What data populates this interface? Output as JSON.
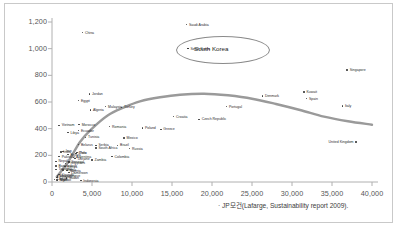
{
  "caption": "· JP모건(Lafarge, Sustainability report 2009).",
  "highlight": {
    "label": "South Korea"
  },
  "colors": {
    "trend_curve": "#9a9a9a",
    "point": "#3a3a3a",
    "axis": "#b0b0b0",
    "text": "#555555",
    "border": "#c9c9c9",
    "background": "#ffffff"
  },
  "chart_data": {
    "type": "scatter",
    "title": "",
    "xlabel": "",
    "ylabel": "",
    "xlim": [
      0,
      40000
    ],
    "ylim": [
      0,
      1200
    ],
    "xticks": [
      "0",
      "5,000",
      "10,000",
      "15,000",
      "20,000",
      "25,000",
      "30,000",
      "35,000",
      "40,000"
    ],
    "xtick_values": [
      0,
      5000,
      10000,
      15000,
      20000,
      25000,
      30000,
      35000,
      40000
    ],
    "yticks": [
      "0",
      "200",
      "400",
      "600",
      "800",
      "1,000",
      "1,200"
    ],
    "ytick_values": [
      0,
      200,
      400,
      600,
      800,
      1000,
      1200
    ],
    "grid": false,
    "legend": "none",
    "annotations": [
      {
        "text": "South Korea",
        "x": 17000,
        "y": 1000,
        "shape": "ellipse-callout"
      }
    ],
    "trend_line": {
      "name": "fitted curve",
      "color": "#9a9a9a",
      "points": [
        {
          "x": 600,
          "y": 40
        },
        {
          "x": 2000,
          "y": 150
        },
        {
          "x": 3500,
          "y": 300
        },
        {
          "x": 5000,
          "y": 400
        },
        {
          "x": 7000,
          "y": 500
        },
        {
          "x": 9000,
          "y": 560
        },
        {
          "x": 11000,
          "y": 605
        },
        {
          "x": 13500,
          "y": 635
        },
        {
          "x": 16000,
          "y": 655
        },
        {
          "x": 19000,
          "y": 662
        },
        {
          "x": 22000,
          "y": 650
        },
        {
          "x": 25000,
          "y": 625
        },
        {
          "x": 28000,
          "y": 585
        },
        {
          "x": 31000,
          "y": 540
        },
        {
          "x": 34000,
          "y": 490
        },
        {
          "x": 37000,
          "y": 455
        },
        {
          "x": 40000,
          "y": 430
        }
      ]
    },
    "points": [
      {
        "label": "Saudi Arabia",
        "x": 16800,
        "y": 1180,
        "label_pos": "right"
      },
      {
        "label": "China",
        "x": 3800,
        "y": 1120,
        "label_pos": "right"
      },
      {
        "label": "South Korea",
        "x": 17000,
        "y": 1000,
        "label_pos": "right"
      },
      {
        "label": "Singapore",
        "x": 36900,
        "y": 840,
        "label_pos": "right"
      },
      {
        "label": "Kuwait",
        "x": 31500,
        "y": 675,
        "label_pos": "right"
      },
      {
        "label": "Jordan",
        "x": 4700,
        "y": 660,
        "label_pos": "right"
      },
      {
        "label": "Denmark",
        "x": 26300,
        "y": 645,
        "label_pos": "right"
      },
      {
        "label": "Spain",
        "x": 31800,
        "y": 625,
        "label_pos": "right"
      },
      {
        "label": "Egypt",
        "x": 3300,
        "y": 610,
        "label_pos": "right"
      },
      {
        "label": "Italy",
        "x": 36300,
        "y": 570,
        "label_pos": "right"
      },
      {
        "label": "Portugal",
        "x": 21800,
        "y": 565,
        "label_pos": "right"
      },
      {
        "label": "Malaysia",
        "x": 6700,
        "y": 565,
        "label_pos": "right"
      },
      {
        "label": "Turkey",
        "x": 8700,
        "y": 560,
        "label_pos": "right"
      },
      {
        "label": "Algeria",
        "x": 4800,
        "y": 540,
        "label_pos": "right"
      },
      {
        "label": "Croatia",
        "x": 15200,
        "y": 490,
        "label_pos": "right"
      },
      {
        "label": "Czech Republic",
        "x": 18400,
        "y": 470,
        "label_pos": "right"
      },
      {
        "label": "Morocco",
        "x": 3400,
        "y": 430,
        "label_pos": "right"
      },
      {
        "label": "Vietnam",
        "x": 900,
        "y": 425,
        "label_pos": "right"
      },
      {
        "label": "Romania",
        "x": 7200,
        "y": 415,
        "label_pos": "right"
      },
      {
        "label": "Poland",
        "x": 11300,
        "y": 405,
        "label_pos": "right"
      },
      {
        "label": "Greece",
        "x": 13600,
        "y": 395,
        "label_pos": "right"
      },
      {
        "label": "Ecuador",
        "x": 3300,
        "y": 385,
        "label_pos": "right"
      },
      {
        "label": "Libya",
        "x": 2000,
        "y": 370,
        "label_pos": "right"
      },
      {
        "label": "Tunisia",
        "x": 4200,
        "y": 335,
        "label_pos": "right"
      },
      {
        "label": "Mexico",
        "x": 9000,
        "y": 330,
        "label_pos": "right"
      },
      {
        "label": "United Kingdom",
        "x": 38000,
        "y": 300,
        "label_pos": "left"
      },
      {
        "label": "Belarus",
        "x": 3300,
        "y": 280,
        "label_pos": "right"
      },
      {
        "label": "Serbia",
        "x": 5500,
        "y": 275,
        "label_pos": "right"
      },
      {
        "label": "Brazil",
        "x": 8200,
        "y": 275,
        "label_pos": "right"
      },
      {
        "label": "South Africa",
        "x": 5500,
        "y": 255,
        "label_pos": "right"
      },
      {
        "label": "Russia",
        "x": 9700,
        "y": 250,
        "label_pos": "right"
      },
      {
        "label": "Iran",
        "x": 1400,
        "y": 230,
        "label_pos": "right"
      },
      {
        "label": "India",
        "x": 1100,
        "y": 225,
        "label_pos": "right"
      },
      {
        "label": "Peru",
        "x": 3100,
        "y": 220,
        "label_pos": "right"
      },
      {
        "label": "Chile",
        "x": 3000,
        "y": 215,
        "label_pos": "right"
      },
      {
        "label": "Bolivia",
        "x": 2000,
        "y": 205,
        "label_pos": "right"
      },
      {
        "label": "Pakistan",
        "x": 900,
        "y": 190,
        "label_pos": "right"
      },
      {
        "label": "Colombia",
        "x": 7500,
        "y": 190,
        "label_pos": "right"
      },
      {
        "label": "Argentina",
        "x": 2700,
        "y": 185,
        "label_pos": "right"
      },
      {
        "label": "Ukraine",
        "x": 2900,
        "y": 175,
        "label_pos": "right"
      },
      {
        "label": "Zambia",
        "x": 5000,
        "y": 165,
        "label_pos": "right"
      },
      {
        "label": "Nepal",
        "x": 500,
        "y": 155,
        "label_pos": "right"
      },
      {
        "label": "Senegal",
        "x": 2100,
        "y": 150,
        "label_pos": "right"
      },
      {
        "label": "Philippines",
        "x": 1700,
        "y": 140,
        "label_pos": "right"
      },
      {
        "label": "Bangladesh",
        "x": 500,
        "y": 120,
        "label_pos": "right"
      },
      {
        "label": "Kenya",
        "x": 1600,
        "y": 115,
        "label_pos": "right"
      },
      {
        "label": "Tanzania",
        "x": 500,
        "y": 95,
        "label_pos": "right"
      },
      {
        "label": "Ghana",
        "x": 1400,
        "y": 90,
        "label_pos": "right"
      },
      {
        "label": "Nigeria",
        "x": 1900,
        "y": 85,
        "label_pos": "right"
      },
      {
        "label": "Cameroon",
        "x": 2100,
        "y": 70,
        "label_pos": "right"
      },
      {
        "label": "Uganda",
        "x": 900,
        "y": 55,
        "label_pos": "right"
      },
      {
        "label": "Mozambique",
        "x": 700,
        "y": 45,
        "label_pos": "right"
      },
      {
        "label": "Ethiopia",
        "x": 600,
        "y": 35,
        "label_pos": "right"
      },
      {
        "label": "Sudan",
        "x": 1800,
        "y": 30,
        "label_pos": "right"
      },
      {
        "label": "Congo",
        "x": 300,
        "y": 20,
        "label_pos": "right"
      },
      {
        "label": "Niger",
        "x": 600,
        "y": 15,
        "label_pos": "right"
      },
      {
        "label": "Malawi",
        "x": 700,
        "y": 12,
        "label_pos": "right"
      },
      {
        "label": "Indonesia",
        "x": 3600,
        "y": 10,
        "label_pos": "right"
      }
    ]
  }
}
